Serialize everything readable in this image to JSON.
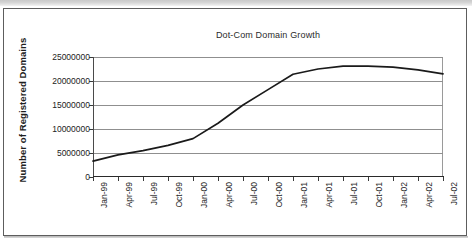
{
  "chart_data": {
    "type": "line",
    "title": "Dot-Com Domain Growth",
    "xlabel": "",
    "ylabel": "Number of Registered Domains",
    "categories": [
      "Jan-99",
      "Apr-99",
      "Jul-99",
      "Oct-99",
      "Jan-00",
      "Apr-00",
      "Jul-00",
      "Oct-00",
      "Jan-01",
      "Apr-01",
      "Jul-01",
      "Oct-01",
      "Jan-02",
      "Apr-02",
      "Jul-02"
    ],
    "values": [
      3300000,
      4600000,
      5500000,
      6600000,
      8000000,
      11200000,
      15000000,
      18200000,
      21400000,
      22500000,
      23100000,
      23100000,
      22900000,
      22300000,
      21500000
    ],
    "series": [
      {
        "name": "Registered Domains",
        "values": [
          3300000,
          4600000,
          5500000,
          6600000,
          8000000,
          11200000,
          15000000,
          18200000,
          21400000,
          22500000,
          23100000,
          23100000,
          22900000,
          22300000,
          21500000
        ],
        "color": "#1a1a1a"
      }
    ],
    "ylim": [
      0,
      25000000
    ],
    "yticks": [
      0,
      5000000,
      10000000,
      15000000,
      20000000,
      25000000
    ],
    "ytick_labels": [
      "0",
      "5000000",
      "10000000",
      "15000000",
      "20000000",
      "25000000"
    ],
    "grid": true,
    "grid_axis": "y",
    "legend": false,
    "legend_position": "none",
    "line_color": "#1a1a1a",
    "grid_color": "#8f8f8f",
    "plot_border_color": "#9a9a9a",
    "background_color": "#ffffff"
  },
  "figure": {
    "frame_color": "#5d5d5d"
  }
}
